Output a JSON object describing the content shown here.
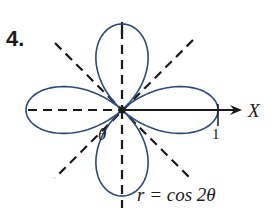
{
  "problem_number": "4.",
  "equation": "r = cos 2θ",
  "axis_label": "X",
  "angle_label": "θ",
  "tick_label": "1",
  "curve": {
    "type": "polar",
    "expression": "cos(2*theta)",
    "petals": 4,
    "max_radius": 1,
    "color": "#2f4a7a"
  },
  "guide_lines": {
    "style": "dashed",
    "angles_deg": [
      0,
      45,
      90,
      135
    ],
    "color": "#1a1a1a"
  }
}
